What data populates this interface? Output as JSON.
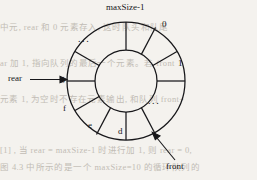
{
  "diagram": {
    "type": "circular-queue",
    "title_label": "maxSize-1",
    "index_labels": [
      "maxSize-1",
      "0",
      "1"
    ],
    "cells": [
      {
        "id": "g",
        "label": "g"
      },
      {
        "id": "f",
        "label": "f"
      },
      {
        "id": "e",
        "label": "e"
      },
      {
        "id": "d",
        "label": "d"
      }
    ],
    "ellipses": [
      "...",
      "..."
    ],
    "pointers": [
      {
        "name": "rear",
        "label": "rear"
      },
      {
        "name": "front",
        "label": "front"
      }
    ],
    "geometry": {
      "center_x": 126,
      "center_y": 81,
      "outer_radius": 59,
      "inner_radius": 31,
      "sector_count": 12
    },
    "colors": {
      "stroke": "#17171a",
      "page": "#f4f2ee",
      "ghost_text": "#b9b4ac"
    }
  },
  "background_text": {
    "line1": "中元, rear 和 0 元素存入, 这时队头和队尾",
    "line2": "ar 加 1, 指向队列的最后一个元素。若 front",
    "line3": "元素 1, 为空时不存在元素输出, 和队列 front+",
    "line4": "[1] , 当 rear = maxSize-1 时进行加 1, 则 rear = 0,",
    "line5": "图 4.3 中所示的是一个 maxSize=10 的循环队列的"
  }
}
